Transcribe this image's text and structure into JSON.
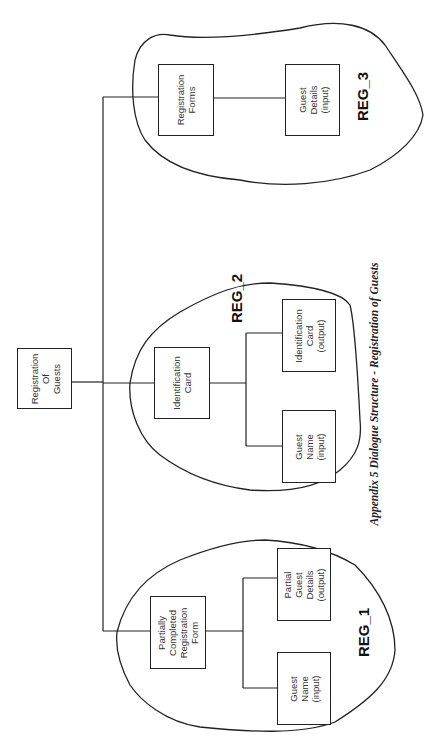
{
  "page": {
    "header_fragment": "",
    "caption": "Appendix 5 Dialogue Structure - Registration of Guests"
  },
  "root": {
    "label": "Registration\nOf\nGuests"
  },
  "regions": [
    {
      "id": "REG_1",
      "label": "REG_1",
      "parent": {
        "label": "Partially\nCompleted\nRegistration\nForm"
      },
      "children": [
        {
          "label": "Partial\nGuest\nDetails\n(output)"
        },
        {
          "label": "Guest\nName\n(input)"
        }
      ]
    },
    {
      "id": "REG_2",
      "label": "REG_2",
      "parent": {
        "label": "Identification\nCard"
      },
      "children": [
        {
          "label": "Identification\nCard\n(output)"
        },
        {
          "label": "Guest\nName\n(input)"
        }
      ]
    },
    {
      "id": "REG_3",
      "label": "REG_3",
      "parent": {
        "label": "Registration\nForms"
      },
      "children": [
        {
          "label": "Guest\nDetails\n(input)"
        }
      ]
    }
  ],
  "colors": {
    "line": "#222222",
    "text": "#333333",
    "background": "#ffffff"
  }
}
